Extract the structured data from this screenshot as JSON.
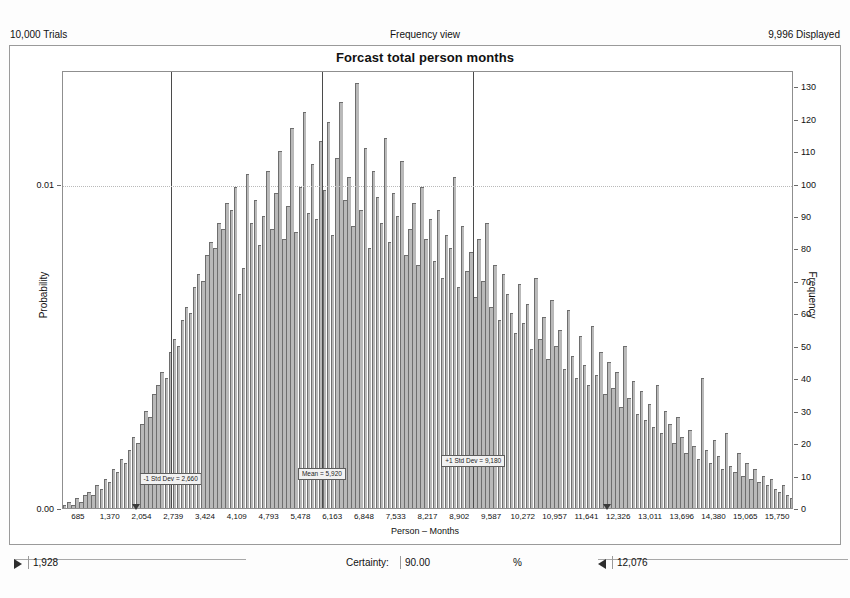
{
  "header": {
    "trials": "10,000 Trials",
    "view_mode": "Frequency view",
    "displayed": "9,996 Displayed"
  },
  "controls": {
    "lower_bound": "1,928",
    "certainty_label": "Certainty:",
    "certainty_value": "90.00",
    "percent_symbol": "%",
    "upper_bound": "12,076",
    "left_arrow_icon": "triangle-right-icon",
    "right_arrow_icon": "triangle-left-icon"
  },
  "chart_data": {
    "type": "bar",
    "title": "Forcast total person months",
    "xlabel": "Person – Months",
    "ylabel": "Probability",
    "y2label": "Frequency",
    "grid": true,
    "legend": "none",
    "xlim": [
      342,
      16093
    ],
    "ylim": [
      0,
      135
    ],
    "y2lim": [
      0,
      135
    ],
    "prob_ticks": [
      "0.00",
      "0.01"
    ],
    "prob_tick_values": [
      0,
      0.01
    ],
    "freq_ticks": [
      0,
      10,
      20,
      30,
      40,
      50,
      60,
      70,
      80,
      90,
      100,
      110,
      120,
      130
    ],
    "xticks": [
      685,
      1370,
      2054,
      2739,
      3424,
      4109,
      4793,
      5478,
      6163,
      6848,
      7533,
      8217,
      8902,
      9587,
      10272,
      10957,
      11641,
      12326,
      13011,
      13696,
      14380,
      15065,
      15750
    ],
    "xtick_labels": [
      "685",
      "1,370",
      "2,054",
      "2,739",
      "3,424",
      "4,109",
      "4,793",
      "5,478",
      "6,163",
      "6,848",
      "7,533",
      "8,217",
      "8,902",
      "9,587",
      "10,272",
      "10,957",
      "11,641",
      "12,326",
      "13,011",
      "13,696",
      "14,380",
      "15,065",
      "15,750"
    ],
    "markers": [
      {
        "name": "minus-1-std-dev",
        "label": "-1 Std Dev = 2,660",
        "x": 2660,
        "label_y_frac": 0.085
      },
      {
        "name": "mean",
        "label": "Mean = 5,920",
        "x": 5920,
        "label_y_frac": 0.095
      },
      {
        "name": "plus-1-std-dev",
        "label": "+1 Std Dev = 9,180",
        "x": 9180,
        "label_y_frac": 0.125
      }
    ],
    "bar_count": 180,
    "values": [
      1,
      2,
      1,
      3,
      2,
      4,
      5,
      4,
      7,
      6,
      9,
      8,
      12,
      11,
      15,
      14,
      18,
      22,
      20,
      26,
      30,
      28,
      35,
      38,
      42,
      40,
      48,
      52,
      50,
      58,
      62,
      60,
      68,
      72,
      70,
      78,
      82,
      80,
      88,
      86,
      94,
      92,
      99,
      66,
      74,
      103,
      88,
      95,
      81,
      90,
      104,
      86,
      97,
      110,
      83,
      93,
      117,
      85,
      99,
      122,
      91,
      106,
      89,
      113,
      98,
      119,
      84,
      108,
      125,
      95,
      102,
      87,
      131,
      92,
      111,
      80,
      104,
      96,
      88,
      114,
      82,
      97,
      90,
      107,
      78,
      86,
      94,
      75,
      99,
      83,
      89,
      76,
      92,
      71,
      84,
      80,
      102,
      68,
      87,
      73,
      79,
      65,
      83,
      70,
      88,
      62,
      75,
      58,
      72,
      66,
      60,
      54,
      69,
      57,
      63,
      49,
      71,
      52,
      59,
      46,
      64,
      50,
      55,
      43,
      61,
      47,
      40,
      53,
      44,
      38,
      56,
      41,
      48,
      35,
      45,
      37,
      42,
      31,
      50,
      34,
      39,
      29,
      36,
      27,
      32,
      25,
      38,
      23,
      30,
      26,
      20,
      28,
      22,
      17,
      24,
      19,
      15,
      40,
      18,
      14,
      21,
      16,
      12,
      23,
      13,
      11,
      17,
      10,
      14,
      9,
      12,
      8,
      10,
      7,
      9,
      6,
      5,
      7,
      4,
      3
    ]
  }
}
